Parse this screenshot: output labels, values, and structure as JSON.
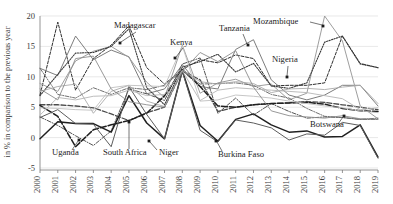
{
  "chart_data": {
    "type": "line",
    "title": "",
    "subtitle": "",
    "xlabel": "",
    "ylabel": "in % in comparison to the previous year",
    "x": [
      2000,
      2001,
      2002,
      2003,
      2004,
      2005,
      2006,
      2007,
      2008,
      2009,
      2010,
      2011,
      2012,
      2013,
      2014,
      2015,
      2016,
      2017,
      2018,
      2019
    ],
    "xtick_labels": [
      "2000",
      "2001",
      "2002",
      "2003",
      "2004",
      "2005",
      "2006",
      "2007",
      "2008",
      "2009",
      "2010",
      "2011",
      "2012",
      "2013",
      "2014",
      "2015",
      "2016",
      "2017",
      "2018",
      "2019"
    ],
    "ytick_labels": [
      "20",
      "15",
      "10",
      "5",
      "0",
      "-5"
    ],
    "ytick_values": [
      20,
      15,
      10,
      5,
      0,
      -5
    ],
    "ylim": [
      -5,
      20
    ],
    "xlim": [
      2000,
      2019
    ],
    "grid": true,
    "grid_axis": "y",
    "legend_position": "inline-annotations",
    "series": [
      {
        "name": "Madagascar",
        "color": "#2f2f2f",
        "dash": "3,1.6",
        "width": 1.0,
        "values": [
          7.0,
          19.0,
          7.8,
          13.0,
          15.2,
          18.4,
          11.5,
          8.8,
          11.2,
          12.8,
          12.3,
          13.6,
          13.0,
          8.5,
          8.6,
          8.6,
          9.0,
          16.7,
          12.2,
          11.5
        ]
      },
      {
        "name": "Kenya",
        "color": "#4a4a4a",
        "dash": "5,2",
        "width": 1.3,
        "values": [
          5.4,
          5.4,
          5.2,
          4.9,
          3.9,
          2.8,
          4.1,
          5.0,
          11.0,
          9.5,
          4.3,
          5.0,
          5.4,
          5.6,
          5.7,
          5.9,
          5.8,
          5.4,
          5.0,
          4.6
        ]
      },
      {
        "name": "Tanzania",
        "color": "#7d7d7d",
        "dash": "",
        "width": 1.0,
        "values": [
          11.4,
          10.2,
          16.7,
          12.8,
          14.4,
          13.3,
          7.2,
          8.0,
          12.0,
          8.4,
          8.0,
          14.5,
          16.1,
          9.5,
          7.0,
          6.2,
          7.0,
          8.6,
          8.6,
          5.2
        ]
      },
      {
        "name": "Mozambique",
        "color": "#9e9e9e",
        "dash": "",
        "width": 1.0,
        "values": [
          8.9,
          7.6,
          12.6,
          14.2,
          15.0,
          13.2,
          9.1,
          6.6,
          15.2,
          7.3,
          9.0,
          9.6,
          8.4,
          8.8,
          6.2,
          7.3,
          20.0,
          15.9,
          5.2,
          3.1
        ]
      },
      {
        "name": "Nigeria",
        "color": "#3a3a3a",
        "dash": "1.3,1.3",
        "width": 1.1,
        "values": [
          6.9,
          10.4,
          13.9,
          14.0,
          15.0,
          17.9,
          8.2,
          5.4,
          11.6,
          12.5,
          13.7,
          10.8,
          12.2,
          8.5,
          8.1,
          9.0,
          15.7,
          16.7,
          12.1,
          11.5
        ]
      },
      {
        "name": "Uganda",
        "color": "#555555",
        "dash": "4,1.5,1,1.5",
        "width": 1.0,
        "values": [
          3.4,
          2.0,
          0.3,
          -1.3,
          1.1,
          8.0,
          7.2,
          6.1,
          12.1,
          13.1,
          4.0,
          6.5,
          3.7,
          5.6,
          4.3,
          3.2,
          3.4,
          3.3,
          3.0,
          3.0
        ]
      },
      {
        "name": "South Africa",
        "color": "#1f1f1f",
        "dash": "6,2",
        "width": 1.5,
        "values": [
          5.3,
          3.5,
          -1.5,
          1.3,
          2.1,
          2.8,
          4.0,
          6.9,
          11.2,
          8.4,
          5.2,
          5.0,
          5.4,
          5.6,
          5.7,
          5.8,
          5.5,
          4.8,
          4.4,
          4.3
        ]
      },
      {
        "name": "Niger",
        "color": "#202020",
        "dash": "",
        "width": 1.5,
        "values": [
          -0.2,
          2.6,
          2.3,
          2.3,
          0.9,
          6.9,
          2.4,
          -0.2,
          11.0,
          2.0,
          -0.6,
          3.0,
          3.9,
          2.1,
          0.9,
          1.1,
          0.1,
          0.2,
          2.1,
          -3.2
        ]
      },
      {
        "name": "Burkina Faso",
        "color": "#5c5c5c",
        "dash": "",
        "width": 1.0,
        "values": [
          3.3,
          4.6,
          2.3,
          2.2,
          -1.5,
          8.4,
          3.8,
          -0.2,
          10.9,
          1.2,
          -0.7,
          2.9,
          2.4,
          1.6,
          -0.4,
          0.6,
          0.4,
          2.5,
          2.0,
          -3.4
        ]
      },
      {
        "name": "Botswana",
        "color": "#707070",
        "dash": "4,1.4,1,1.4",
        "width": 1.0,
        "values": [
          11.4,
          7.1,
          6.5,
          8.2,
          7.1,
          8.2,
          7.9,
          8.6,
          11.0,
          8.8,
          8.9,
          9.0,
          8.6,
          7.1,
          6.5,
          4.8,
          3.5,
          3.3,
          3.0,
          3.2
        ]
      },
      {
        "name": "series-grey-a",
        "color": "#aaaaaa",
        "dash": "",
        "width": 0.9,
        "values": [
          7.6,
          8.4,
          8.8,
          4.0,
          7.6,
          8.6,
          6.0,
          5.1,
          11.1,
          9.2,
          8.8,
          9.2,
          8.9,
          7.4,
          8.0,
          8.1,
          7.9,
          8.3,
          8.6,
          5.6
        ]
      },
      {
        "name": "series-grey-b",
        "color": "#b5b5b5",
        "dash": "",
        "width": 0.9,
        "values": [
          3.7,
          6.6,
          6.2,
          6.8,
          6.9,
          7.8,
          6.9,
          7.1,
          11.0,
          6.1,
          7.8,
          8.2,
          8.0,
          7.8,
          7.6,
          7.4,
          6.9,
          6.4,
          4.6,
          4.9
        ]
      },
      {
        "name": "series-grey-c",
        "color": "#c0c0c0",
        "dash": "",
        "width": 0.9,
        "values": [
          4.9,
          4.8,
          4.6,
          4.5,
          8.2,
          8.6,
          8.5,
          8.4,
          15.1,
          6.0,
          6.2,
          7.0,
          6.8,
          6.5,
          6.0,
          5.6,
          5.2,
          4.9,
          4.4,
          4.1
        ]
      },
      {
        "name": "series-grey-d",
        "color": "#8c8c8c",
        "dash": "",
        "width": 0.9,
        "values": [
          8.0,
          6.2,
          13.0,
          13.4,
          8.0,
          5.9,
          5.4,
          5.0,
          10.9,
          14.0,
          12.5,
          14.3,
          8.3,
          4.4,
          3.6,
          3.4,
          3.2,
          3.6,
          3.1,
          3.0
        ]
      }
    ],
    "annotations": [
      {
        "label": "Madagascar",
        "x": 114,
        "y": 28,
        "anchor": "start",
        "leader": [
          [
            136,
            32
          ],
          [
            121,
            42
          ]
        ],
        "dot": [
          120,
          43
        ]
      },
      {
        "label": "Kenya",
        "x": 170,
        "y": 45,
        "anchor": "start",
        "leader": [
          [
            183,
            48
          ],
          [
            176,
            57
          ]
        ],
        "dot": [
          175,
          58
        ]
      },
      {
        "label": "Tanzania",
        "x": 219,
        "y": 31,
        "anchor": "start",
        "leader": [
          [
            243,
            34
          ],
          [
            247,
            44
          ]
        ],
        "dot": [
          248,
          45
        ]
      },
      {
        "label": "Mozambique",
        "x": 253,
        "y": 24,
        "anchor": "start",
        "leader": [
          [
            310,
            22
          ],
          [
            322,
            25
          ]
        ],
        "dot": [
          323,
          26
        ]
      },
      {
        "label": "Nigeria",
        "x": 272,
        "y": 62,
        "anchor": "start",
        "leader": [
          [
            288,
            66
          ],
          [
            287,
            76
          ]
        ],
        "dot": [
          287,
          77
        ]
      },
      {
        "label": "Botswana",
        "x": 310,
        "y": 127,
        "anchor": "start",
        "leader": [
          [
            338,
            124
          ],
          [
            343,
            117
          ]
        ],
        "dot": [
          344,
          116
        ]
      },
      {
        "label": "Uganda",
        "x": 52,
        "y": 155,
        "anchor": "start",
        "leader": [
          [
            72,
            150
          ],
          [
            78,
            141
          ]
        ],
        "dot": [
          79,
          140
        ]
      },
      {
        "label": "South Africa",
        "x": 103,
        "y": 155,
        "anchor": "start",
        "leader": [
          [
            129,
            149
          ],
          [
            129,
            123
          ]
        ],
        "dot": [
          129,
          122
        ]
      },
      {
        "label": "Niger",
        "x": 159,
        "y": 155,
        "anchor": "start",
        "leader": [
          [
            157,
            150
          ],
          [
            150,
            142
          ]
        ],
        "dot": [
          149,
          141
        ]
      },
      {
        "label": "Burkina Faso",
        "x": 218,
        "y": 157,
        "anchor": "start",
        "leader": [
          [
            222,
            151
          ],
          [
            217,
            142
          ]
        ],
        "dot": [
          216,
          141
        ]
      }
    ]
  }
}
